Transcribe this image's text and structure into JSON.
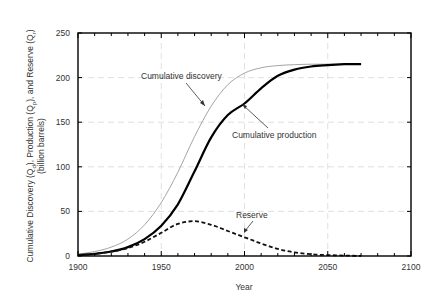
{
  "chart_data": {
    "type": "line",
    "title": "",
    "xlabel": "Year",
    "ylabel": "Cumulative Discovery (Qd), Production (Qp), and Reserve (Qr)",
    "ylabel_line2": "(billion barrels)",
    "xlim": [
      1900,
      2100
    ],
    "ylim": [
      0,
      250
    ],
    "xticks": [
      1900,
      1950,
      2000,
      2050,
      2100
    ],
    "yticks": [
      0,
      50,
      100,
      150,
      200,
      250
    ],
    "grid": true,
    "legend": "none (inline annotations with arrows)",
    "x": [
      1900,
      1910,
      1920,
      1930,
      1940,
      1950,
      1960,
      1970,
      1980,
      1990,
      2000,
      2010,
      2020,
      2030,
      2040,
      2050,
      2060,
      2070
    ],
    "series": [
      {
        "name": "Cumulative discovery",
        "style": "thin solid gray",
        "values": [
          2,
          5,
          10,
          19,
          35,
          60,
          94,
          134,
          168,
          192,
          205,
          211,
          213.5,
          214.5,
          215,
          215,
          215,
          215
        ]
      },
      {
        "name": "Cumulative production",
        "style": "thick solid black",
        "values": [
          1,
          2.5,
          5,
          10,
          19,
          34,
          58,
          95,
          133,
          158,
          171,
          188,
          202,
          209,
          212.5,
          214,
          215,
          215
        ]
      },
      {
        "name": "Reserve",
        "style": "thick dashed black",
        "values": [
          1,
          2.5,
          5,
          9,
          16,
          26,
          36,
          39,
          35,
          28,
          21,
          14,
          8,
          4,
          2,
          1,
          0.5,
          0
        ]
      }
    ],
    "annotations": [
      {
        "text": "Cumulative discovery",
        "target": "Cumulative discovery"
      },
      {
        "text": "Cumulative production",
        "target": "Cumulative production"
      },
      {
        "text": "Reserve",
        "target": "Reserve"
      }
    ]
  },
  "labels": {
    "xlabel": "Year",
    "ylabel_line1": "Cumulative Discovery (Q",
    "ylabel_line2": "(billion barrels)",
    "annot_discovery": "Cumulative discovery",
    "annot_production": "Cumulative production",
    "annot_reserve": "Reserve"
  },
  "colors": {
    "discovery": "#9a9a9a",
    "production": "#000000",
    "reserve": "#111111",
    "grid": "#d8d8d8",
    "frame": "#000000"
  }
}
